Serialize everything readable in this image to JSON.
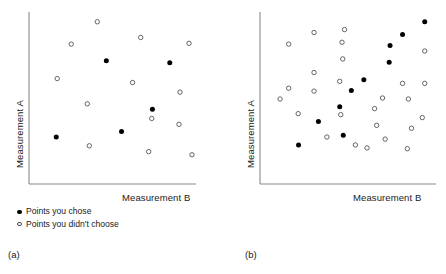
{
  "figure": {
    "background": "#ffffff",
    "axis_color": "#8a8a8a",
    "point_fill_color": "#000000",
    "point_open_stroke": "#555555"
  },
  "legend": {
    "chose_label": "Points you chose",
    "not_chose_label": "Points you didn't choose",
    "chose_marker": "filled-circle-icon",
    "not_chose_marker": "open-circle-icon"
  },
  "panels": [
    {
      "id": "a",
      "caption": "(a)",
      "x_axis_label": "Measurement B",
      "y_axis_label": "Measurement A"
    },
    {
      "id": "b",
      "caption": "(b)",
      "x_axis_label": "Measurement B",
      "y_axis_label": "Measurement A"
    }
  ],
  "chart_data": [
    {
      "type": "scatter",
      "title": "(a)",
      "xlabel": "Measurement B",
      "ylabel": "Measurement A",
      "xlim": [
        0,
        100
      ],
      "ylim": [
        0,
        100
      ],
      "grid": false,
      "legend_position": "below-left",
      "axis_style": "open-left-bottom-spines-no-ticks",
      "series": [
        {
          "name": "Points you chose",
          "marker": "filled-circle",
          "points": [
            [
              46.3,
              71.6
            ],
            [
              84.3,
              70.5
            ],
            [
              16.3,
              27.3
            ],
            [
              55.4,
              30.5
            ],
            [
              73.9,
              43.4
            ]
          ]
        },
        {
          "name": "Points you didn't choose",
          "marker": "open-circle",
          "points": [
            [
              40.9,
              94.3
            ],
            [
              25.3,
              81.3
            ],
            [
              16.9,
              61.3
            ],
            [
              66.9,
              85.2
            ],
            [
              95.8,
              81.8
            ],
            [
              62.0,
              59.0
            ],
            [
              90.4,
              53.4
            ],
            [
              34.9,
              46.6
            ],
            [
              36.1,
              22.2
            ],
            [
              73.5,
              38.1
            ],
            [
              89.8,
              34.7
            ],
            [
              71.7,
              18.8
            ],
            [
              97.6,
              17.0
            ]
          ]
        }
      ]
    },
    {
      "type": "scatter",
      "title": "(b)",
      "xlabel": "Measurement B",
      "ylabel": "Measurement A",
      "xlim": [
        0,
        100
      ],
      "ylim": [
        0,
        100
      ],
      "grid": false,
      "legend_position": "shared-with-panel-a",
      "axis_style": "open-left-bottom-spines-no-ticks",
      "series": [
        {
          "name": "Points you chose",
          "marker": "filled-circle",
          "points": [
            [
              93.6,
              94.3
            ],
            [
              81.0,
              86.9
            ],
            [
              73.9,
              80.5
            ],
            [
              73.4,
              70.8
            ],
            [
              59.0,
              60.6
            ],
            [
              51.9,
              54.3
            ],
            [
              45.3,
              44.9
            ],
            [
              33.2,
              36.4
            ],
            [
              21.9,
              22.7
            ],
            [
              47.3,
              28.4
            ]
          ]
        },
        {
          "name": "Points you didn't choose",
          "marker": "open-circle",
          "points": [
            [
              30.7,
              88.1
            ],
            [
              48.0,
              89.8
            ],
            [
              16.3,
              81.3
            ],
            [
              46.6,
              82.4
            ],
            [
              47.0,
              72.7
            ],
            [
              30.7,
              64.8
            ],
            [
              45.3,
              59.7
            ],
            [
              16.3,
              55.7
            ],
            [
              93.6,
              77.3
            ],
            [
              81.0,
              58.5
            ],
            [
              93.6,
              58.5
            ],
            [
              30.7,
              54.0
            ],
            [
              11.4,
              49.4
            ],
            [
              69.6,
              50.0
            ],
            [
              84.3,
              49.4
            ],
            [
              65.1,
              43.8
            ],
            [
              21.7,
              40.9
            ],
            [
              45.9,
              40.3
            ],
            [
              66.3,
              34.1
            ],
            [
              86.1,
              32.4
            ],
            [
              38.0,
              27.3
            ],
            [
              71.1,
              26.1
            ],
            [
              54.2,
              22.7
            ],
            [
              60.8,
              21.0
            ],
            [
              83.7,
              20.5
            ],
            [
              92.2,
              38.6
            ]
          ]
        }
      ]
    }
  ]
}
